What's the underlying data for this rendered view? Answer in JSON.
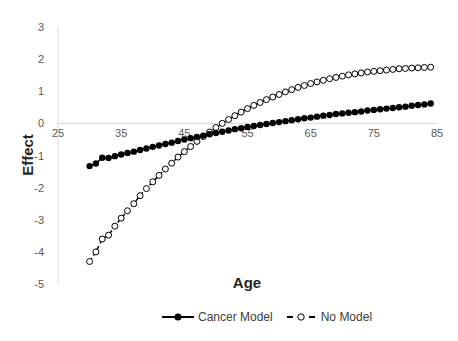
{
  "chart_data": {
    "type": "line",
    "title": "",
    "xlabel": "Age",
    "ylabel": "Effect",
    "xlim": [
      25,
      85
    ],
    "ylim": [
      -5,
      3
    ],
    "x_ticks": [
      25,
      35,
      45,
      55,
      65,
      75,
      85
    ],
    "y_ticks": [
      3,
      2,
      1,
      0,
      -1,
      -2,
      -3,
      -4,
      -5
    ],
    "grid": false,
    "legend_position": "bottom",
    "x": [
      30,
      31,
      32,
      33,
      34,
      35,
      36,
      37,
      38,
      39,
      40,
      41,
      42,
      43,
      44,
      45,
      46,
      47,
      48,
      49,
      50,
      51,
      52,
      53,
      54,
      55,
      56,
      57,
      58,
      59,
      60,
      61,
      62,
      63,
      64,
      65,
      66,
      67,
      68,
      69,
      70,
      71,
      72,
      73,
      74,
      75,
      76,
      77,
      78,
      79,
      80,
      81,
      82,
      83,
      84
    ],
    "series": [
      {
        "name": "Cancer Model",
        "marker": "filled-circle",
        "line": "solid",
        "color": "#000000",
        "values": [
          -1.33,
          -1.25,
          -1.07,
          -1.08,
          -1.02,
          -0.97,
          -0.92,
          -0.88,
          -0.83,
          -0.78,
          -0.73,
          -0.69,
          -0.64,
          -0.6,
          -0.55,
          -0.5,
          -0.46,
          -0.42,
          -0.38,
          -0.34,
          -0.3,
          -0.26,
          -0.22,
          -0.18,
          -0.15,
          -0.11,
          -0.08,
          -0.05,
          -0.02,
          0.01,
          0.04,
          0.07,
          0.1,
          0.13,
          0.16,
          0.18,
          0.21,
          0.24,
          0.26,
          0.29,
          0.31,
          0.33,
          0.35,
          0.37,
          0.4,
          0.42,
          0.44,
          0.46,
          0.48,
          0.5,
          0.52,
          0.55,
          0.57,
          0.59,
          0.62
        ]
      },
      {
        "name": "No Model",
        "marker": "open-circle",
        "line": "dashed",
        "color": "#000000",
        "values": [
          -4.3,
          -4.0,
          -3.6,
          -3.48,
          -3.2,
          -2.95,
          -2.72,
          -2.5,
          -2.25,
          -2.03,
          -1.82,
          -1.62,
          -1.42,
          -1.24,
          -1.05,
          -0.88,
          -0.72,
          -0.56,
          -0.41,
          -0.27,
          -0.13,
          0.0,
          0.12,
          0.24,
          0.35,
          0.46,
          0.56,
          0.65,
          0.74,
          0.82,
          0.9,
          0.98,
          1.05,
          1.12,
          1.18,
          1.24,
          1.29,
          1.34,
          1.39,
          1.43,
          1.47,
          1.51,
          1.54,
          1.57,
          1.6,
          1.62,
          1.64,
          1.66,
          1.68,
          1.7,
          1.71,
          1.72,
          1.73,
          1.74,
          1.75
        ]
      }
    ]
  },
  "plot": {
    "left": 58,
    "right": 437,
    "top": 27,
    "bottom": 284
  },
  "labels": {
    "x_axis_title": "Age",
    "y_axis_title": "Effect",
    "legend_cancer": "Cancer Model",
    "legend_none": "No Model"
  }
}
